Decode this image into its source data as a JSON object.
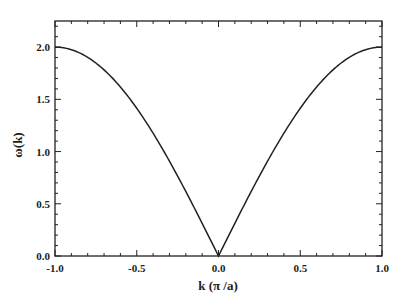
{
  "chart_data": {
    "type": "line",
    "title": "",
    "xlabel": "k (π /a)",
    "ylabel": "ω(k)",
    "xlim": [
      -1.0,
      1.0
    ],
    "ylim": [
      0.0,
      2.25
    ],
    "xticks": [
      "-1.0",
      "-0.5",
      "0.0",
      "0.5",
      "1.0"
    ],
    "yticks": [
      "0.0",
      "0.5",
      "1.0",
      "1.5",
      "2.0"
    ],
    "grid": false,
    "legend": null,
    "series": [
      {
        "name": "dispersion",
        "color": "#222222",
        "x": [
          -1.0,
          -0.9,
          -0.8,
          -0.7,
          -0.6,
          -0.5,
          -0.4,
          -0.3,
          -0.2,
          -0.1,
          0.0,
          0.1,
          0.2,
          0.3,
          0.4,
          0.5,
          0.6,
          0.7,
          0.8,
          0.9,
          1.0
        ],
        "y": [
          2.0,
          1.975,
          1.902,
          1.782,
          1.618,
          1.414,
          1.176,
          0.908,
          0.618,
          0.313,
          0.0,
          0.313,
          0.618,
          0.908,
          1.176,
          1.414,
          1.618,
          1.782,
          1.902,
          1.975,
          2.0
        ]
      }
    ]
  }
}
